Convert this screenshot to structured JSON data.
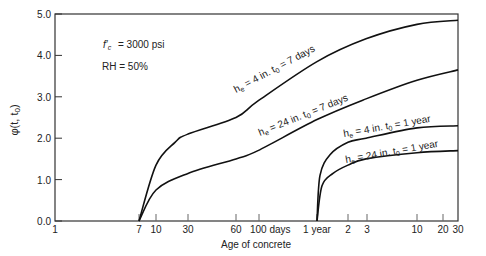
{
  "chart_data": {
    "type": "line",
    "title": "",
    "xlabel": "Age of concrete",
    "ylabel": "φ(t, t0)",
    "xscale": "log",
    "ylim": [
      0,
      5.0
    ],
    "grid": false,
    "yticks": [
      "0.0",
      "1.0",
      "2.0",
      "3.0",
      "4.0",
      "5.0"
    ],
    "xticks": [
      {
        "label": "1",
        "px": 55
      },
      {
        "label": "7",
        "px": 139
      },
      {
        "label": "10",
        "px": 156
      },
      {
        "label": "30",
        "px": 188
      },
      {
        "label": "60",
        "px": 236
      },
      {
        "label": "100 days",
        "px": 259
      },
      {
        "label": "1 year",
        "px": 317
      },
      {
        "label": "2",
        "px": 348
      },
      {
        "label": "3",
        "px": 367
      },
      {
        "label": "10",
        "px": 417
      },
      {
        "label": "20",
        "px": 443
      },
      {
        "label": "30",
        "px": 458
      }
    ],
    "annotations": [
      {
        "text": "f'c = 3000 psi"
      },
      {
        "text": "RH = 50%"
      }
    ],
    "series": [
      {
        "name": "he = 4 in.  t0 = 7 days",
        "he": "4 in.",
        "t0": "7 days",
        "points": [
          [
            139,
            0
          ],
          [
            156,
            1.35
          ],
          [
            175,
            1.9
          ],
          [
            188,
            2.1
          ],
          [
            236,
            2.5
          ],
          [
            258,
            2.9
          ],
          [
            317,
            3.85
          ],
          [
            366,
            4.4
          ],
          [
            417,
            4.75
          ],
          [
            458,
            4.85
          ]
        ]
      },
      {
        "name": "he = 24 in.  t0 = 7 days",
        "he": "24 in.",
        "t0": "7 days",
        "points": [
          [
            139,
            0
          ],
          [
            156,
            0.75
          ],
          [
            188,
            1.15
          ],
          [
            236,
            1.5
          ],
          [
            258,
            1.7
          ],
          [
            317,
            2.45
          ],
          [
            366,
            2.95
          ],
          [
            417,
            3.4
          ],
          [
            458,
            3.65
          ]
        ]
      },
      {
        "name": "he = 4 in.  t0 = 1 year",
        "he": "4 in.",
        "t0": "1 year",
        "points": [
          [
            317,
            0
          ],
          [
            320,
            1.1
          ],
          [
            330,
            1.6
          ],
          [
            348,
            1.9
          ],
          [
            366,
            2.0
          ],
          [
            417,
            2.25
          ],
          [
            458,
            2.3
          ]
        ]
      },
      {
        "name": "he = 24 in.  t0 = 1 year",
        "he": "24 in.",
        "t0": "1 year",
        "points": [
          [
            317,
            0
          ],
          [
            322,
            0.85
          ],
          [
            333,
            1.15
          ],
          [
            348,
            1.35
          ],
          [
            366,
            1.5
          ],
          [
            417,
            1.65
          ],
          [
            458,
            1.7
          ]
        ]
      }
    ]
  },
  "labels": {
    "xlabel": "Age of concrete",
    "fc": "= 3000 psi",
    "rh": "RH = 50%",
    "s1": "h  = 4 in.   t  = 7 days",
    "s2": "h  = 24 in.   t  = 7 days",
    "s3": "h  = 4 in.    t  = 1 year",
    "s4": "h  = 24 in.    t  = 1 year"
  }
}
